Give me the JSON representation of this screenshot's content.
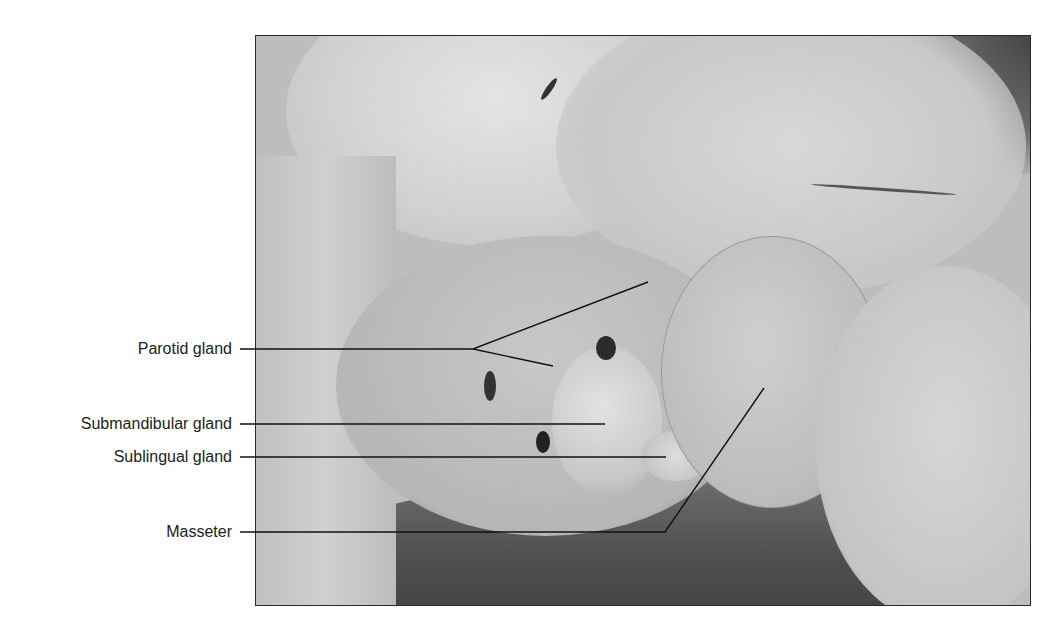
{
  "figure": {
    "labels": [
      {
        "id": "parotid",
        "text": "Parotid gland"
      },
      {
        "id": "submandibular",
        "text": "Submandibular gland"
      },
      {
        "id": "sublingual",
        "text": "Sublingual gland"
      },
      {
        "id": "masseter",
        "text": "Masseter"
      }
    ],
    "colors": {
      "background": "#ffffff",
      "photo_border": "#2a2a2a",
      "leader_line": "#111111",
      "label_text": "#222222",
      "tissue_light": "#d2d2d2",
      "tissue_mid": "#b4b4b4",
      "backdrop_dark": "#5a5a5a"
    }
  }
}
